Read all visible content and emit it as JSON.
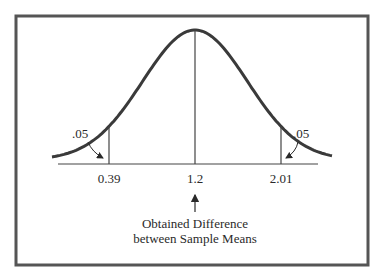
{
  "chart_data": {
    "type": "line",
    "title": "",
    "curve": "normal",
    "mean": 1.2,
    "critical_values": [
      0.39,
      2.01
    ],
    "tick_labels": [
      "0.39",
      "1.2",
      "2.01"
    ],
    "tail_areas": [
      {
        "side": "left",
        "label": ".05"
      },
      {
        "side": "right",
        "label": ".05"
      }
    ],
    "annotation": {
      "line1": "Obtained Difference",
      "line2": "between Sample Means",
      "points_to": 1.2
    },
    "xlabel": "",
    "ylabel": "",
    "grid": false
  },
  "colors": {
    "frame": "#555555",
    "curve": "#3a3a3a",
    "axis": "#444444",
    "text": "#2a2a2a"
  }
}
